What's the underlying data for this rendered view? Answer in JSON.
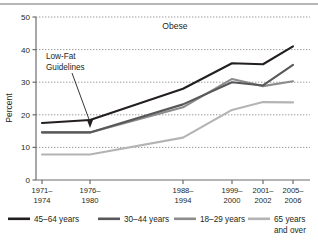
{
  "figure": {
    "title_in_plot": "Obese",
    "y_axis_label": "Percent",
    "annotation": {
      "line1": "Low-Fat",
      "line2": "Guidelines"
    }
  },
  "axis": {
    "y_ticks": [
      "0",
      "10",
      "20",
      "30",
      "40",
      "50"
    ],
    "x_ticks": [
      {
        "top": "1971–",
        "bottom": "1974"
      },
      {
        "top": "1976–",
        "bottom": "1980"
      },
      {
        "top": "1988–",
        "bottom": "1994"
      },
      {
        "top": "1999–",
        "bottom": "2000"
      },
      {
        "top": "2001–",
        "bottom": "2002"
      },
      {
        "top": "2005–",
        "bottom": "2006"
      }
    ]
  },
  "legend": {
    "items": [
      {
        "label": "45–64 years",
        "label2": "",
        "color": "#231f20"
      },
      {
        "label": "30–44 years",
        "label2": "",
        "color": "#58585a"
      },
      {
        "label": "18–29 years",
        "label2": "",
        "color": "#8c8c8e"
      },
      {
        "label": "65 years",
        "label2": "and over",
        "color": "#b4b4b6"
      }
    ]
  },
  "chart_data": {
    "type": "line",
    "title": "Obese",
    "xlabel": "",
    "ylabel": "Percent",
    "ylim": [
      0,
      50
    ],
    "grid": true,
    "legend_position": "bottom",
    "categories": [
      "1971–1974",
      "1976–1980",
      "1988–1994",
      "1999–2000",
      "2001–2002",
      "2005–2006"
    ],
    "x_positions": [
      42,
      90,
      183,
      232,
      263,
      293
    ],
    "annotations": [
      {
        "text": "Low-Fat Guidelines",
        "points_to_category": "1976–1980",
        "points_to_value": 14.6
      }
    ],
    "series": [
      {
        "name": "45–64 years",
        "color": "#231f20",
        "values": [
          17.5,
          18.4,
          28.0,
          35.8,
          35.5,
          41.0
        ]
      },
      {
        "name": "30–44 years",
        "color": "#58585a",
        "values": [
          14.6,
          14.6,
          23.2,
          30.0,
          29.0,
          35.3
        ]
      },
      {
        "name": "18–29 years",
        "color": "#8c8c8e",
        "values": [
          14.6,
          14.6,
          22.3,
          31.0,
          28.8,
          30.3
        ]
      },
      {
        "name": "65 years and over",
        "color": "#b4b4b6",
        "values": [
          7.8,
          7.8,
          13.0,
          21.5,
          23.9,
          23.8
        ]
      }
    ]
  }
}
